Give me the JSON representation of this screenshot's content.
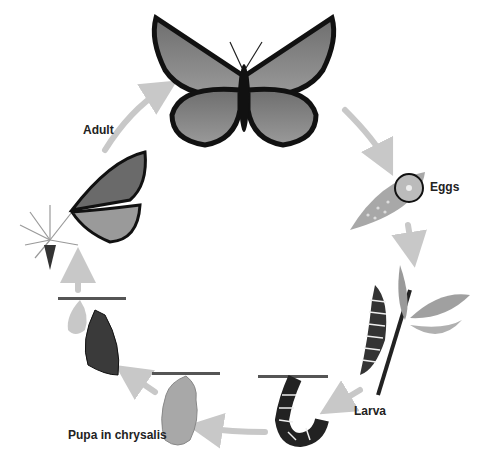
{
  "diagram": {
    "stages": [
      {
        "id": "adult",
        "label": "Adult"
      },
      {
        "id": "eggs",
        "label": "Eggs"
      },
      {
        "id": "larva",
        "label": "Larva"
      },
      {
        "id": "pupa",
        "label": "Pupa in chrysalis"
      }
    ],
    "cycle_order": [
      "Adult",
      "Eggs",
      "Larva",
      "Pupa in chrysalis",
      "Adult"
    ],
    "colors": {
      "background": "#ffffff",
      "arrow": "#c8c8c8",
      "wing_dark": "#1a1a1a",
      "wing_light": "#8a8a8a",
      "leaf": "#a8a8a8",
      "text": "#222222"
    }
  }
}
